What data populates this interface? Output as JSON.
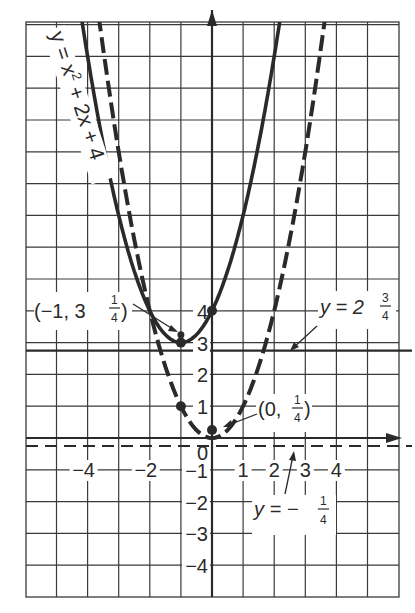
{
  "chart_data": {
    "type": "line",
    "title": "",
    "xlabel": "",
    "ylabel": "",
    "xlim": [
      -6,
      6
    ],
    "ylim": [
      -5,
      13.2
    ],
    "grid": true,
    "x_tick_labels": [
      "-4",
      "-2",
      "1",
      "2",
      "3",
      "4"
    ],
    "x_tick_values": [
      -4,
      -2,
      1,
      2,
      3,
      4
    ],
    "y_tick_labels": [
      "4",
      "3",
      "2",
      "1",
      "0",
      "-1",
      "-2",
      "-3",
      "-4"
    ],
    "y_tick_values": [
      4,
      3,
      2,
      1,
      0,
      -1,
      -2,
      -3,
      -4
    ],
    "series": [
      {
        "name": "y = x^2 + 2x + 4",
        "style": "solid",
        "equation": {
          "a": 1,
          "b": 2,
          "c": 4
        },
        "label": "y = x² + 2x + 4",
        "vertex": [
          -1,
          3
        ],
        "focus": [
          -1,
          3.25
        ],
        "focus_label": "(−1, 3 1/4)",
        "directrix": 2.75,
        "directrix_label": "y = 2 3/4",
        "marked_points": [
          [
            -1,
            3
          ],
          [
            0,
            4
          ],
          [
            -1,
            3.25
          ]
        ]
      },
      {
        "name": "y = x^2",
        "style": "dashed",
        "equation": {
          "a": 1,
          "b": 0,
          "c": 0
        },
        "vertex": [
          0,
          0
        ],
        "focus": [
          0,
          0.25
        ],
        "focus_label": "(0, 1/4)",
        "directrix": -0.25,
        "directrix_label": "y = − 1/4",
        "marked_points": [
          [
            -1,
            1
          ],
          [
            0,
            0.25
          ]
        ]
      }
    ],
    "annotations": [
      {
        "text": "y = x² + 2x + 4",
        "target": "solid parabola"
      },
      {
        "text": "(−1, 3 1/4)",
        "target": "focus of solid parabola"
      },
      {
        "text": "y = 2 3/4",
        "target": "directrix of solid parabola"
      },
      {
        "text": "(0, 1/4)",
        "target": "focus of dashed parabola"
      },
      {
        "text": "y = − 1/4",
        "target": "directrix of dashed parabola"
      }
    ]
  },
  "labels": {
    "equation_main": "y = x",
    "equation_sup": "2",
    "equation_rest": " + 2x + 4",
    "focus1_open": "(−1, 3",
    "focus1_num": "1",
    "focus1_den": "4",
    "focus1_close": ")",
    "directrix1_text": "y = 2",
    "directrix1_num": "3",
    "directrix1_den": "4",
    "focus2_open": "(0,",
    "focus2_num": "1",
    "focus2_den": "4",
    "focus2_close": ")",
    "directrix2_text": "y = −",
    "directrix2_num": "1",
    "directrix2_den": "4",
    "origin": "0"
  },
  "colors": {
    "ink": "#2a2a2a",
    "grid": "#3a3a3a",
    "background": "#ffffff"
  }
}
